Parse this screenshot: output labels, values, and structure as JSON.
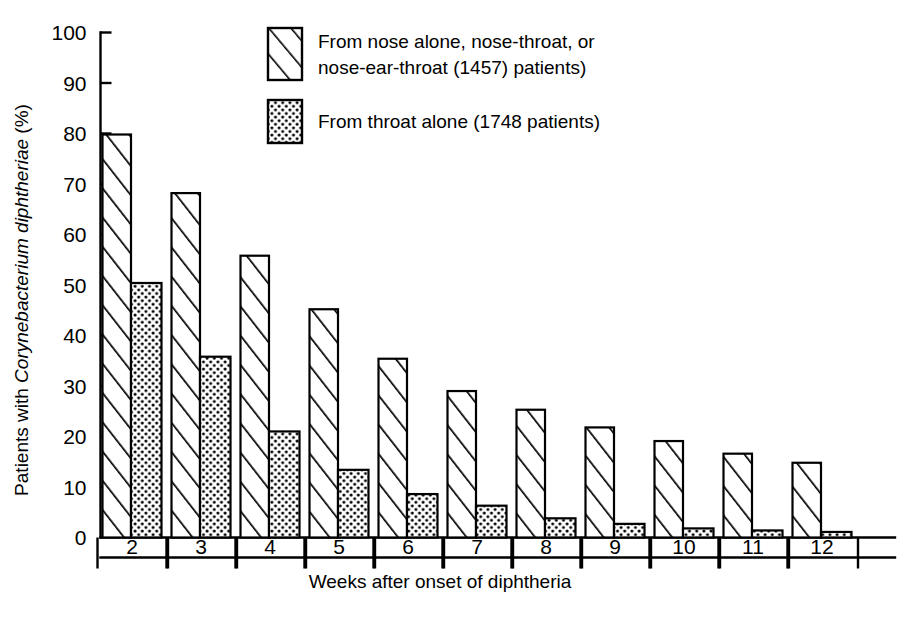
{
  "chart_data": {
    "type": "bar",
    "title": "",
    "subtitle": "",
    "xlabel": "Weeks after onset of diphtheria",
    "ylabel": "Patients with Corynebacterium diphtheriae (%)",
    "ylabel_parts": {
      "pre": "Patients with ",
      "italic": "Corynebacterium diphtheriae",
      "post": " (%)"
    },
    "categories": [
      "2",
      "3",
      "4",
      "5",
      "6",
      "7",
      "8",
      "9",
      "10",
      "11",
      "12"
    ],
    "x_tick_labels": [
      "2",
      "3",
      "4",
      "5",
      "6",
      "7",
      "8",
      "9",
      "10",
      "11",
      "12"
    ],
    "y_tick_labels": [
      "0",
      "10",
      "20",
      "30",
      "40",
      "50",
      "60",
      "70",
      "80",
      "90",
      "100"
    ],
    "y_ticks": [
      0,
      10,
      20,
      30,
      40,
      50,
      60,
      70,
      80,
      90,
      100
    ],
    "ylim": [
      0,
      100
    ],
    "grid": false,
    "legend_position": "top-right-inside",
    "series": [
      {
        "name": "From nose alone, nose-throat, or nose-ear-throat (1457) patients)",
        "pattern": "diagonal-hatch",
        "values": [
          79.8,
          68.2,
          55.8,
          45.2,
          35.4,
          29.0,
          25.3,
          21.8,
          19.1,
          16.6,
          14.8
        ]
      },
      {
        "name": "From throat alone (1748 patients)",
        "pattern": "dots",
        "values": [
          50.4,
          35.8,
          21.0,
          13.4,
          8.6,
          6.3,
          3.8,
          2.7,
          1.8,
          1.4,
          1.1
        ]
      }
    ],
    "legend_entries": [
      {
        "pattern": "diagonal-hatch",
        "line1": "From nose alone, nose-throat, or",
        "line2": "nose-ear-throat (1457) patients)"
      },
      {
        "pattern": "dots",
        "line1": "From throat alone (1748 patients)",
        "line2": ""
      }
    ],
    "colors": {
      "ink": "#000000",
      "background": "#ffffff",
      "hatch_fill": "#ffffff",
      "dot_fill": "#ffffff"
    }
  }
}
